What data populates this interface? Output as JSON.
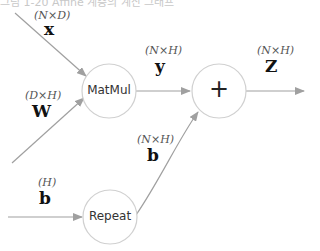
{
  "caption": "그림 1-20 Affine 계층의 계산 그래프",
  "nodes": {
    "matmul": {
      "label": "MatMul"
    },
    "add": {
      "label": "+"
    },
    "repeat": {
      "label": "Repeat"
    }
  },
  "edges": {
    "x": {
      "name": "x",
      "shape": "(N×D)"
    },
    "W": {
      "name": "W",
      "shape": "(D×H)"
    },
    "b_in": {
      "name": "b",
      "shape": "(H)"
    },
    "y": {
      "name": "y",
      "shape": "(N×H)"
    },
    "b_rep": {
      "name": "b",
      "shape": "(N×H)"
    },
    "Z": {
      "name": "Z",
      "shape": "(N×H)"
    }
  },
  "colors": {
    "line": "#a0a0a0",
    "node_border": "#d0d0d0"
  }
}
